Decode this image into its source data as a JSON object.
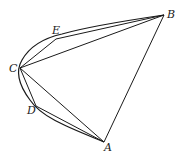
{
  "diagram": {
    "type": "geometry",
    "points": {
      "A": {
        "label": "A",
        "x": 104,
        "y": 142
      },
      "B": {
        "label": "B",
        "x": 164,
        "y": 15
      },
      "C": {
        "label": "C",
        "x": 20,
        "y": 68
      },
      "D": {
        "label": "D",
        "x": 36,
        "y": 106
      },
      "E": {
        "label": "E",
        "x": 56,
        "y": 39
      }
    },
    "segments": [
      [
        "A",
        "B"
      ],
      [
        "B",
        "C"
      ],
      [
        "C",
        "A"
      ],
      [
        "C",
        "E"
      ],
      [
        "E",
        "B"
      ],
      [
        "C",
        "D"
      ],
      [
        "D",
        "A"
      ]
    ],
    "curve": "parabolic arc from A through D, C, E to B",
    "stroke_color": "#1a1a1a"
  }
}
